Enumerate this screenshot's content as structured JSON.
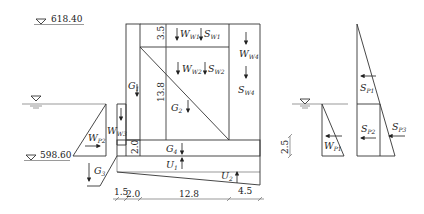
{
  "elevations": {
    "top": "618.40",
    "bottom": "598.60"
  },
  "dimensions": {
    "vertical": {
      "top_segment": "3.5",
      "middle_segment": "13.8",
      "slab": "2.0",
      "right_water_depth": "2.5"
    },
    "horizontal": [
      "1.5",
      "2.0",
      "12.8",
      "4.5"
    ]
  },
  "loads": {
    "G1": {
      "main": "G",
      "sub": "1"
    },
    "G2": {
      "main": "G",
      "sub": "2"
    },
    "G3": {
      "main": "G",
      "sub": "3"
    },
    "G4": {
      "main": "G",
      "sub": "4"
    },
    "U1": {
      "main": "U",
      "sub": "1"
    },
    "U2": {
      "main": "U",
      "sub": "2"
    },
    "Ww1": {
      "main": "W",
      "sub": "W1"
    },
    "Ww2": {
      "main": "W",
      "sub": "W2"
    },
    "Ww3": {
      "main": "W",
      "sub": "W3"
    },
    "Ww4": {
      "main": "W",
      "sub": "W4"
    },
    "Sw1": {
      "main": "S",
      "sub": "W1"
    },
    "Sw2": {
      "main": "S",
      "sub": "W2"
    },
    "Sw4": {
      "main": "S",
      "sub": "W4"
    },
    "Wp1": {
      "main": "W",
      "sub": "P1"
    },
    "Wp2": {
      "main": "W",
      "sub": "P2"
    },
    "Sp1": {
      "main": "S",
      "sub": "P1"
    },
    "Sp2": {
      "main": "S",
      "sub": "P2"
    },
    "Sp3": {
      "main": "S",
      "sub": "P3"
    }
  }
}
